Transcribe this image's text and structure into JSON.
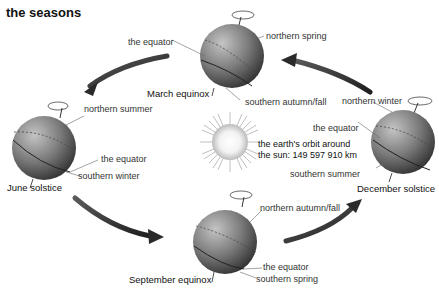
{
  "title": "the seasons",
  "sun": {
    "orbit_line1": "the earth's orbit around",
    "orbit_line2": "the sun: 149 597 910 km"
  },
  "globes": {
    "march": {
      "caption": "March equinox",
      "labels": {
        "equator": "the equator",
        "north": "northern spring",
        "south": "southern autumn/fall"
      }
    },
    "june": {
      "caption": "June solstice",
      "labels": {
        "north": "northern summer",
        "equator": "the equator",
        "south": "southern winter"
      }
    },
    "december": {
      "caption": "December solstice",
      "labels": {
        "north": "northern winter",
        "equator": "the equator",
        "south": "southern summer"
      }
    },
    "september": {
      "caption": "September equinox",
      "labels": {
        "north": "northern autumn/fall",
        "equator": "the equator",
        "south": "southern spring"
      }
    }
  },
  "colors": {
    "globe_dark": "#3f3f3f",
    "globe_light": "#a8a8a8",
    "arrow": "#2f2f2f",
    "sun_core": "#ffffff",
    "sun_rays": "#bdbdbd"
  }
}
